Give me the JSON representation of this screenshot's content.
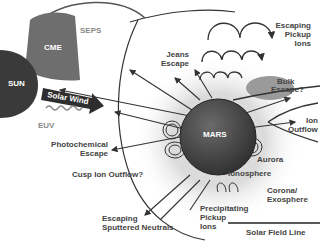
{
  "diagram": {
    "colors": {
      "background": "#ffffff",
      "sun": "#3a3a3a",
      "cme": "#6e6e6e",
      "mars": "#4a4a4a",
      "line": "#333333",
      "label": "#444444",
      "muted_label": "#8a8a8a"
    },
    "sun": {
      "label": "SUN"
    },
    "cme": {
      "label": "CME"
    },
    "seps": {
      "label": "SEPS"
    },
    "solar_wind": {
      "label": "Solar Wind"
    },
    "euv": {
      "label": "EUV"
    },
    "mars": {
      "label": "MARS"
    },
    "labels": {
      "escaping_pickup_ions": [
        "Escaping",
        "Pickup",
        "Ions"
      ],
      "jeans_escape": [
        "Jeans",
        "Escape"
      ],
      "bulk_escape": [
        "Bulk",
        "Escape?"
      ],
      "ion_outflow": [
        "Ion",
        "Outflow"
      ],
      "photochemical_escape": [
        "Photochemical",
        "Escape"
      ],
      "cusp_ion_outflow": "Cusp Ion Outflow?",
      "aurora": "Aurora",
      "ionosphere": "Ionosphere",
      "corona_exosphere": [
        "Corona/",
        "Exosphere"
      ],
      "precipitating_pickup_ions": [
        "Precipitating",
        "Pickup",
        "Ions"
      ],
      "escaping_sputtered_neutrals": [
        "Escaping",
        "Sputtered Neutrals"
      ],
      "solar_field_line": "Solar Field Line"
    }
  }
}
